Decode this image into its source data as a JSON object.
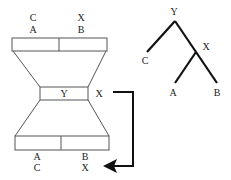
{
  "diagram": {
    "top_box": {
      "labels_row1": [
        "C",
        "X"
      ],
      "labels_row2": [
        "A",
        "B"
      ]
    },
    "middle_box": {
      "label": "Y",
      "side_label": "X"
    },
    "bottom_box": {
      "labels_row1": [
        "A",
        "B"
      ],
      "labels_row2": [
        "C",
        "X"
      ]
    },
    "tree": {
      "root": "Y",
      "internal": "X",
      "leaves": [
        "C",
        "A",
        "B"
      ]
    },
    "colors": {
      "line": "#222222",
      "box_stroke": "#555555",
      "background": "#ffffff"
    }
  }
}
